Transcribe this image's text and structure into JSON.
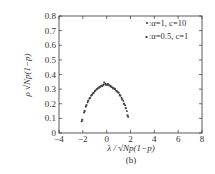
{
  "chart_data": {
    "type": "scatter",
    "title": "",
    "caption": "(b)",
    "xlabel": "λ / √Np(1−p)",
    "ylabel": "ρ √Np(1−p)",
    "xlim": [
      -4,
      8
    ],
    "ylim": [
      0,
      0.8
    ],
    "xticks": [
      -4,
      -2,
      0,
      2,
      4,
      6,
      8
    ],
    "yticks": [
      0,
      0.1,
      0.2,
      0.3,
      0.4,
      0.5,
      0.6,
      0.7,
      0.8
    ],
    "xtick_labels": [
      "−4",
      "−2",
      "0",
      "2",
      "4",
      "6",
      "8"
    ],
    "ytick_labels": [
      "0",
      "0.1",
      "0.2",
      "0.3",
      "0.4",
      "0.5",
      "0.6",
      "0.7",
      "0.8"
    ],
    "grid": false,
    "legend_position": "upper right",
    "series": [
      {
        "name": ":α=1, c=10",
        "marker": "dot",
        "x": [
          -2.1,
          -1.9,
          -1.75,
          -1.6,
          -1.45,
          -1.3,
          -1.15,
          -1.0,
          -0.85,
          -0.7,
          -0.55,
          -0.4,
          -0.25,
          -0.1,
          0.05,
          0.2,
          0.35,
          0.5,
          0.65,
          0.8,
          0.95,
          1.1,
          1.25,
          1.4,
          1.55,
          1.7,
          1.8
        ],
        "y": [
          0.08,
          0.14,
          0.18,
          0.21,
          0.235,
          0.255,
          0.27,
          0.285,
          0.3,
          0.31,
          0.315,
          0.32,
          0.33,
          0.335,
          0.33,
          0.325,
          0.32,
          0.31,
          0.305,
          0.29,
          0.28,
          0.26,
          0.24,
          0.22,
          0.19,
          0.15,
          0.11
        ]
      },
      {
        "name": ":α=0.5, c=1",
        "marker": "square",
        "x": [
          -2.05,
          -1.85,
          -1.7,
          -1.55,
          -1.4,
          -1.25,
          -1.1,
          -0.95,
          -0.8,
          -0.65,
          -0.5,
          -0.35,
          -0.2,
          -0.05,
          0.1,
          0.25,
          0.4,
          0.55,
          0.7,
          0.85,
          1.0,
          1.15,
          1.3,
          1.45,
          1.6,
          1.75
        ],
        "y": [
          0.09,
          0.15,
          0.19,
          0.22,
          0.24,
          0.26,
          0.275,
          0.29,
          0.3,
          0.31,
          0.32,
          0.325,
          0.345,
          0.33,
          0.335,
          0.325,
          0.315,
          0.305,
          0.3,
          0.285,
          0.275,
          0.255,
          0.23,
          0.2,
          0.17,
          0.12
        ]
      }
    ]
  }
}
